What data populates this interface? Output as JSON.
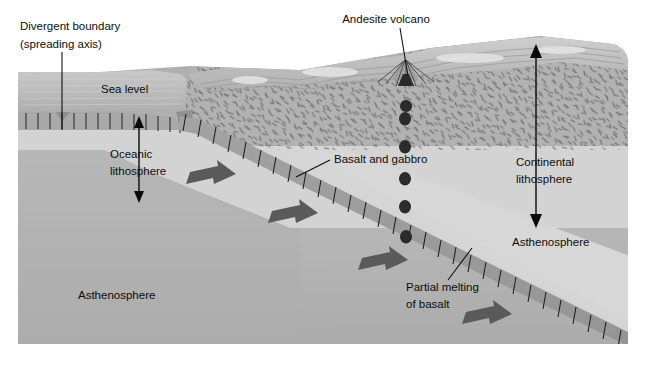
{
  "figure": {
    "type": "geologic-cross-section"
  },
  "labels": {
    "divergent_boundary_line1": "Divergent boundary",
    "divergent_boundary_line2": "(spreading axis)",
    "sea_level": "Sea level",
    "andesite_volcano": "Andesite volcano",
    "oceanic_lithosphere_line1": "Oceanic",
    "oceanic_lithosphere_line2": "lithosphere",
    "basalt_and_gabbro": "Basalt and gabbro",
    "continental_lithosphere_line1": "Continental",
    "continental_lithosphere_line2": "lithosphere",
    "asthenosphere_right": "Asthenosphere",
    "asthenosphere_left": "Asthenosphere",
    "partial_melting_line1": "Partial melting",
    "partial_melting_line2": "of basalt"
  },
  "colors": {
    "background": "#ffffff",
    "ocean_water": "#b9b9b9",
    "ocean_water_light": "#c9c9c9",
    "oceanic_crust": "#a8a8a8",
    "upper_mantle_light": "#d2d2d2",
    "asthenosphere_mid": "#b4b4b4",
    "asthenosphere_deep": "#a9a9a9",
    "continental_crust": "#b0b0b0",
    "continental_surface": "#c4c4c4",
    "slab": "#9a9a9a",
    "slab_tick": "#1a1a1a",
    "motion_arrow": "#595959",
    "magma_blob": "#2b2b2b",
    "label_text": "#0d0d0d",
    "leader_line": "#111111"
  },
  "features": {
    "spreading_ridge": "mid-ocean ridge spreading axis",
    "subducting_slab": "oceanic lithosphere descending beneath continent",
    "magma_ascent": "teardrop magma blobs rising from slab to volcano",
    "motion_arrow_count": 4,
    "magma_blob_count": 6,
    "dike_tick_count": 14
  }
}
